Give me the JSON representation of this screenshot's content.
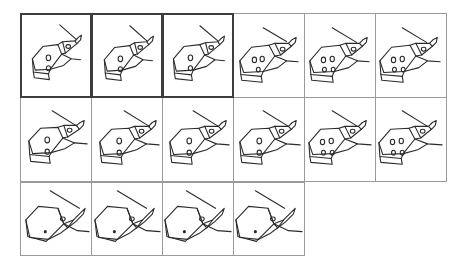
{
  "canvas": {
    "width": 471,
    "height": 273,
    "background": "#ffffff",
    "stroke_color": "#2b2b2b",
    "cell_border_color": "#9a9a9a",
    "selected_border_color": "#3d3d3d"
  },
  "grid": {
    "columns": 6,
    "rows": 3,
    "cell_width": 72,
    "cell_height": 85,
    "last_row_cell_height": 74,
    "total_frames": 16,
    "selected_count": 3
  },
  "frames": [
    {
      "index": 1,
      "row": 1,
      "column": 1,
      "label": "frame-1",
      "selected": true,
      "view": "hand-fist-pointing-finger",
      "knuckle_dots": 2,
      "scale": "medium",
      "finger_angle_deg": -28
    },
    {
      "index": 2,
      "row": 1,
      "column": 2,
      "label": "frame-2",
      "selected": true,
      "view": "hand-fist-pointing-finger",
      "knuckle_dots": 2,
      "scale": "medium",
      "finger_angle_deg": -28
    },
    {
      "index": 3,
      "row": 1,
      "column": 3,
      "label": "frame-3",
      "selected": true,
      "view": "hand-fist-pointing-finger",
      "knuckle_dots": 2,
      "scale": "medium",
      "finger_angle_deg": -28
    },
    {
      "index": 4,
      "row": 1,
      "column": 4,
      "label": "frame-4",
      "selected": false,
      "view": "hand-fist-pointing-finger",
      "knuckle_dots": 3,
      "scale": "medium",
      "finger_angle_deg": -28
    },
    {
      "index": 5,
      "row": 1,
      "column": 5,
      "label": "frame-5",
      "selected": false,
      "view": "hand-fist-pointing-finger",
      "knuckle_dots": 4,
      "scale": "medium",
      "finger_angle_deg": -28
    },
    {
      "index": 6,
      "row": 1,
      "column": 6,
      "label": "frame-6",
      "selected": false,
      "view": "hand-fist-pointing-finger",
      "knuckle_dots": 4,
      "scale": "medium",
      "finger_angle_deg": -28
    },
    {
      "index": 7,
      "row": 2,
      "column": 1,
      "label": "frame-7",
      "selected": false,
      "view": "hand-fist-pointing-finger",
      "knuckle_dots": 2,
      "scale": "medium",
      "finger_angle_deg": -25
    },
    {
      "index": 8,
      "row": 2,
      "column": 2,
      "label": "frame-8",
      "selected": false,
      "view": "hand-fist-pointing-finger",
      "knuckle_dots": 2,
      "scale": "medium",
      "finger_angle_deg": -25
    },
    {
      "index": 9,
      "row": 2,
      "column": 3,
      "label": "frame-9",
      "selected": false,
      "view": "hand-fist-pointing-finger",
      "knuckle_dots": 2,
      "scale": "medium",
      "finger_angle_deg": -25
    },
    {
      "index": 10,
      "row": 2,
      "column": 4,
      "label": "frame-10",
      "selected": false,
      "view": "hand-fist-pointing-finger",
      "knuckle_dots": 2,
      "scale": "medium",
      "finger_angle_deg": -25
    },
    {
      "index": 11,
      "row": 2,
      "column": 5,
      "label": "frame-11",
      "selected": false,
      "view": "hand-fist-pointing-finger",
      "knuckle_dots": 4,
      "scale": "medium",
      "finger_angle_deg": -25
    },
    {
      "index": 12,
      "row": 2,
      "column": 6,
      "label": "frame-12",
      "selected": false,
      "view": "hand-fist-pointing-finger",
      "knuckle_dots": 4,
      "scale": "medium",
      "finger_angle_deg": -25
    },
    {
      "index": 13,
      "row": 3,
      "column": 1,
      "label": "frame-13",
      "selected": false,
      "view": "hand-fist-closeup",
      "knuckle_dots": 1,
      "scale": "large",
      "finger_angle_deg": -22
    },
    {
      "index": 14,
      "row": 3,
      "column": 2,
      "label": "frame-14",
      "selected": false,
      "view": "hand-fist-closeup",
      "knuckle_dots": 1,
      "scale": "large",
      "finger_angle_deg": -22
    },
    {
      "index": 15,
      "row": 3,
      "column": 3,
      "label": "frame-15",
      "selected": false,
      "view": "hand-fist-closeup",
      "knuckle_dots": 1,
      "scale": "large",
      "finger_angle_deg": -22
    },
    {
      "index": 16,
      "row": 3,
      "column": 4,
      "label": "frame-16",
      "selected": false,
      "view": "hand-fist-closeup",
      "knuckle_dots": 1,
      "scale": "large",
      "finger_angle_deg": -22
    }
  ]
}
